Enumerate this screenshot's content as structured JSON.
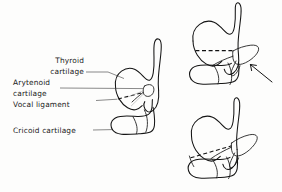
{
  "figure": {
    "background_color": "#fdfdfc",
    "stroke_color": "#141414",
    "leader_color": "#3a3a3a",
    "label_color": "#1a1a1a"
  },
  "labels": {
    "thyroid_line1": "Thyroid",
    "thyroid_line2": "cartilage",
    "arytenoid_line1": "Arytenoid",
    "arytenoid_line2": "cartilage",
    "vocal_ligament": "Vocal  ligament",
    "cricoid": "Cricoid cartilage"
  },
  "panels": [
    {
      "name": "main-labeled-view",
      "position": "left"
    },
    {
      "name": "neutral-position-view",
      "position": "top-right"
    },
    {
      "name": "rotated-position-view",
      "position": "bottom-right"
    }
  ],
  "annotations": {
    "arrow_label": "rotation-arrow"
  }
}
